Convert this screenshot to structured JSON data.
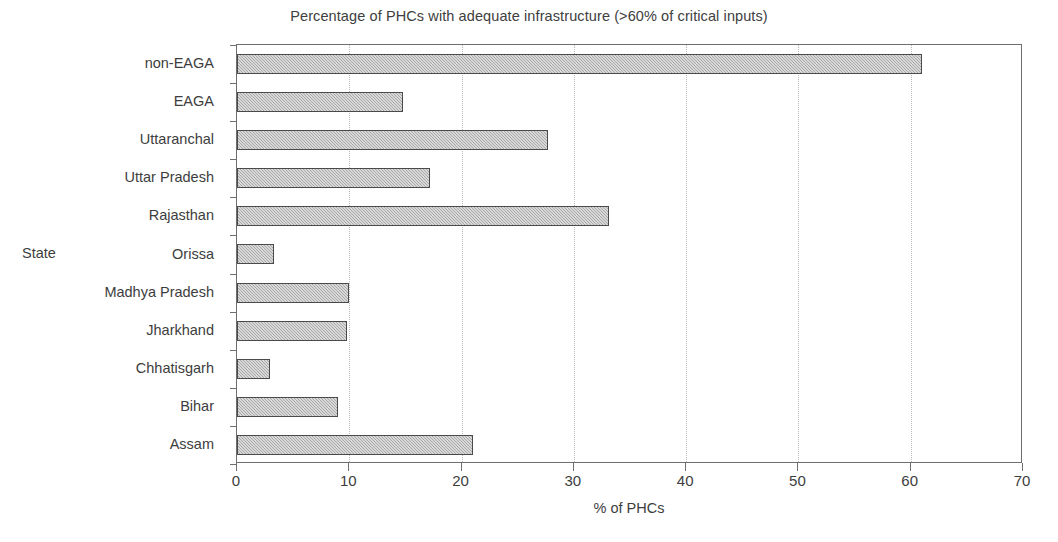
{
  "chart_data": {
    "type": "bar",
    "orientation": "horizontal",
    "title": "Percentage of PHCs with adequate infrastructure (>60% of critical inputs)",
    "xlabel": "% of PHCs",
    "ylabel": "State",
    "categories": [
      "non-EAGA",
      "EAGA",
      "Uttaranchal",
      "Uttar Pradesh",
      "Rajasthan",
      "Orissa",
      "Madhya Pradesh",
      "Jharkhand",
      "Chhatisgarh",
      "Bihar",
      "Assam"
    ],
    "values": [
      61.0,
      14.8,
      27.7,
      17.2,
      33.1,
      3.3,
      10.0,
      9.8,
      2.9,
      9.0,
      21.0
    ],
    "xlim": [
      0,
      70
    ],
    "xticks": [
      0,
      10,
      20,
      30,
      40,
      50,
      60,
      70
    ],
    "xtick_labels": [
      "0",
      "10",
      "20",
      "30",
      "40",
      "50",
      "60",
      "70"
    ],
    "grid": "vertical-dotted",
    "legend": "none",
    "colors": {
      "bar_fill": "#a9a9a9",
      "bar_border": "#4a4a4a",
      "gridline": "#b9b9b9",
      "axis": "#6e6e6e",
      "text": "#3d3d3d",
      "background": "#ffffff"
    }
  }
}
